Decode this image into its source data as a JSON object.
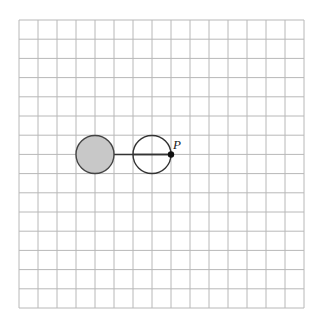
{
  "diagram": {
    "grid": {
      "columns": 15,
      "rows": 15,
      "origin_x": 19,
      "origin_y": 20,
      "cell_w": 19,
      "cell_h": 19.2,
      "line_color": "#b8b8b8"
    },
    "shaded_circle": {
      "cx": 95,
      "cy": 154.5,
      "r": 19,
      "fill": "#c8c8c8",
      "stroke": "#444444"
    },
    "open_circle": {
      "cx": 152,
      "cy": 154.5,
      "r": 19,
      "fill": "#ffffff",
      "stroke": "#333333"
    },
    "connector_line": {
      "x1": 95,
      "y1": 154.5,
      "x2": 171,
      "y2": 154.5,
      "stroke": "#333333"
    },
    "point": {
      "label": "P",
      "cx": 171,
      "cy": 154.5,
      "r": 3.2,
      "fill": "#111111"
    }
  }
}
